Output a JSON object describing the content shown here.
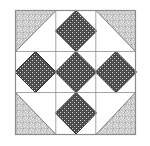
{
  "figure": {
    "title": "Quilt Block Diagram",
    "canvas": {
      "width": 150,
      "height": 146
    },
    "background_color": "#ffffff"
  },
  "block": {
    "name": "nine-patch-quilt-block",
    "frame": {
      "x": 15,
      "y": 10,
      "width": 121,
      "height": 125
    },
    "grid_rows": 3,
    "grid_columns": 3,
    "frame_line_color": "#8c8c8c",
    "grid_line_color": "#9a9a9a",
    "frame_line_width": 1.2,
    "grid_line_width": 0.9
  },
  "fabrics": {
    "background": {
      "label": "white background fabric",
      "base_color": "#ffffff",
      "texture": "solid"
    },
    "light": {
      "label": "light gray speckled fabric",
      "base_color": "#c9c9c9",
      "speck_light": "#eeeeee",
      "speck_dark": "#a6a6a6",
      "texture": "speckle"
    },
    "dark": {
      "label": "dark gray dotted fabric",
      "base_color": "#4a4a4a",
      "dot_color": "#d8d8d8",
      "outline_color": "#2b2b2b",
      "texture": "dots"
    }
  },
  "cells": [
    {
      "row": 0,
      "col": 0,
      "name": "top-left-corner-triangle",
      "shape": "half-square-triangle",
      "fabric": "light",
      "orientation": "triangle-upper-left"
    },
    {
      "row": 0,
      "col": 1,
      "name": "top-center-diamond",
      "shape": "on-point-square",
      "fabric": "dark",
      "orientation": "diamond"
    },
    {
      "row": 0,
      "col": 2,
      "name": "top-right-corner-triangle",
      "shape": "half-square-triangle",
      "fabric": "light",
      "orientation": "triangle-upper-right"
    },
    {
      "row": 1,
      "col": 0,
      "name": "middle-left-diamond",
      "shape": "on-point-square",
      "fabric": "dark",
      "orientation": "diamond"
    },
    {
      "row": 1,
      "col": 1,
      "name": "center-diamond",
      "shape": "on-point-square",
      "fabric": "dark",
      "orientation": "diamond"
    },
    {
      "row": 1,
      "col": 2,
      "name": "middle-right-diamond",
      "shape": "on-point-square",
      "fabric": "dark",
      "orientation": "diamond"
    },
    {
      "row": 2,
      "col": 0,
      "name": "bottom-left-corner-triangle",
      "shape": "half-square-triangle",
      "fabric": "light",
      "orientation": "triangle-lower-left"
    },
    {
      "row": 2,
      "col": 1,
      "name": "bottom-center-diamond",
      "shape": "on-point-square",
      "fabric": "dark",
      "orientation": "diamond"
    },
    {
      "row": 2,
      "col": 2,
      "name": "bottom-right-corner-triangle",
      "shape": "half-square-triangle",
      "fabric": "light",
      "orientation": "triangle-lower-right"
    }
  ]
}
